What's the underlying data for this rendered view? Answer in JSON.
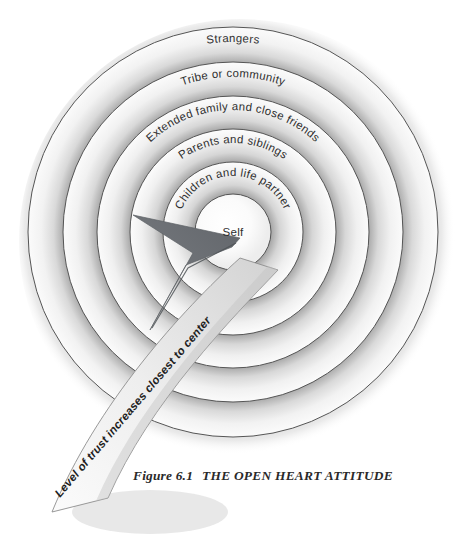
{
  "figure": {
    "caption_number": "Figure 6.1",
    "caption_title": "THE OPEN HEART ATTITUDE",
    "background_color": "#ffffff",
    "ink_color": "#2e2e2e"
  },
  "diagram": {
    "type": "concentric-rings",
    "center": {
      "x": 233,
      "y": 232
    },
    "outer_radius": 205,
    "rings": [
      {
        "index": 0,
        "label": "Strangers",
        "outer_radius": 205,
        "inner_radius": 170,
        "text_path_radius": 190,
        "curved": true
      },
      {
        "index": 1,
        "label": "Tribe or community",
        "outer_radius": 170,
        "inner_radius": 136,
        "text_path_radius": 155,
        "curved": true
      },
      {
        "index": 2,
        "label": "Extended family and close friends",
        "outer_radius": 136,
        "inner_radius": 103,
        "text_path_radius": 122,
        "curved": true
      },
      {
        "index": 3,
        "label": "Parents and siblings",
        "outer_radius": 103,
        "inner_radius": 70,
        "text_path_radius": 89,
        "curved": true
      },
      {
        "index": 4,
        "label": "Children and life partner",
        "outer_radius": 70,
        "inner_radius": 38,
        "text_path_radius": 56,
        "curved": true
      },
      {
        "index": 5,
        "label": "Self",
        "outer_radius": 38,
        "inner_radius": 0,
        "text_path_radius": 0,
        "curved": false
      }
    ],
    "ring_fill_light": "#fdfdfd",
    "ring_fill_dark": "#b4b4b4",
    "ring_stroke": "#5a5a5a"
  },
  "arrow": {
    "label": "Level of trust increases closest to center",
    "direction": "lower-left-to-center",
    "head_color": "#6f7277",
    "banner_fill": "#f4f4f4",
    "banner_stroke": "#8a8a8a",
    "tip": {
      "x": 240,
      "y": 238
    }
  }
}
